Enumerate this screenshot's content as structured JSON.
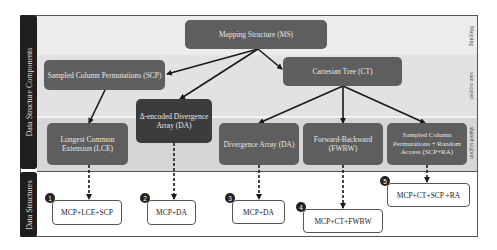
{
  "sections": {
    "left_top": "Data Structure Components",
    "left_bottom": "Data Structures",
    "right_mapping": "Mapping",
    "right_start_support": "start support",
    "right_shared_support": "shared support"
  },
  "components": {
    "ms": "Mapping Structure (MS)",
    "scp": "Sampled Column Permutations (SCP)",
    "ct": "Cartesian Tree (CT)",
    "delta_da": "Δ-encoded Divergence Array (DA)",
    "lce": "Longest Common Extension (LCE)",
    "da": "Divergence Array (DA)",
    "fwbw": "Forward-Backward (FWBW)",
    "scp_ra": "Sampled Column Permutations + Random Access (SCP+RA)"
  },
  "structures": [
    {
      "number": "1",
      "label": "MCP+LCE+SCP"
    },
    {
      "number": "2",
      "label": "MCP+DA"
    },
    {
      "number": "3",
      "label": "MCP+DA"
    },
    {
      "number": "4",
      "label": "MCP+CT+FWBW"
    },
    {
      "number": "5",
      "label": "MCP+CT+SCP +RA"
    }
  ],
  "colors": {
    "node": "#5e5e5e",
    "node_dark": "#3c3c3c",
    "sidebar": "#1e1e1e",
    "arrow": "#1a1a1a"
  }
}
